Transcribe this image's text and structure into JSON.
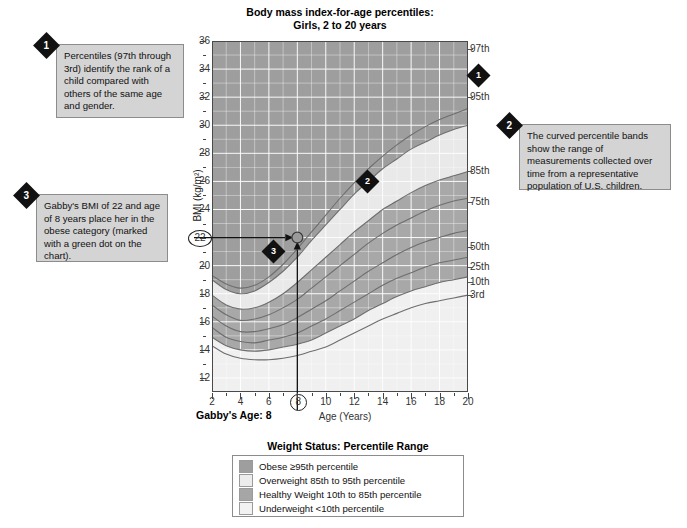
{
  "chart_data": {
    "type": "line",
    "title": "Body mass index-for-age percentiles:\nGirls, 2 to 20 years",
    "title_line1": "Body mass index-for-age percentiles:",
    "title_line2": "Girls, 2 to 20 years",
    "xlabel": "Age (Years)",
    "ylabel": "BMI (kg/m²)",
    "xlim": [
      2,
      20
    ],
    "ylim": [
      11,
      36
    ],
    "grid": true,
    "x_ticks": [
      "2",
      "4",
      "6",
      "8",
      "10",
      "12",
      "14",
      "16",
      "18",
      "20"
    ],
    "y_ticks": [
      "12",
      "14",
      "16",
      "18",
      "20",
      "22",
      "24",
      "26",
      "28",
      "30",
      "32",
      "34",
      "36"
    ],
    "highlighted_x_tick": "8",
    "highlighted_y_tick": "22",
    "legend_position": "right-of-axes",
    "series": [
      {
        "name": "97th",
        "x": [
          2,
          3,
          4,
          5,
          6,
          7,
          8,
          9,
          10,
          11,
          12,
          13,
          14,
          15,
          16,
          17,
          18,
          19,
          20
        ],
        "values": [
          19.3,
          18.7,
          18.4,
          18.6,
          19.2,
          20.1,
          21.2,
          22.4,
          23.6,
          24.8,
          25.9,
          26.9,
          27.8,
          28.6,
          29.3,
          29.9,
          30.4,
          30.8,
          31.2
        ]
      },
      {
        "name": "95th",
        "x": [
          2,
          3,
          4,
          5,
          6,
          7,
          8,
          9,
          10,
          11,
          12,
          13,
          14,
          15,
          16,
          17,
          18,
          19,
          20
        ],
        "values": [
          19.0,
          18.3,
          18.0,
          18.2,
          18.8,
          19.6,
          20.6,
          21.8,
          22.9,
          24.0,
          25.1,
          26.0,
          26.9,
          27.6,
          28.3,
          28.8,
          29.3,
          29.7,
          30.0
        ]
      },
      {
        "name": "85th",
        "x": [
          2,
          3,
          4,
          5,
          6,
          7,
          8,
          9,
          10,
          11,
          12,
          13,
          14,
          15,
          16,
          17,
          18,
          19,
          20
        ],
        "values": [
          17.9,
          17.2,
          16.9,
          17.0,
          17.4,
          18.0,
          18.8,
          19.7,
          20.6,
          21.5,
          22.4,
          23.2,
          24.0,
          24.6,
          25.2,
          25.7,
          26.1,
          26.4,
          26.7
        ]
      },
      {
        "name": "75th",
        "x": [
          2,
          3,
          4,
          5,
          6,
          7,
          8,
          9,
          10,
          11,
          12,
          13,
          14,
          15,
          16,
          17,
          18,
          19,
          20
        ],
        "values": [
          17.2,
          16.5,
          16.1,
          16.2,
          16.5,
          17.0,
          17.6,
          18.4,
          19.2,
          20.0,
          20.8,
          21.6,
          22.3,
          22.9,
          23.4,
          23.9,
          24.3,
          24.6,
          24.8
        ]
      },
      {
        "name": "50th",
        "x": [
          2,
          3,
          4,
          5,
          6,
          7,
          8,
          9,
          10,
          11,
          12,
          13,
          14,
          15,
          16,
          17,
          18,
          19,
          20
        ],
        "values": [
          16.4,
          15.7,
          15.3,
          15.3,
          15.5,
          15.8,
          16.3,
          16.9,
          17.5,
          18.2,
          18.9,
          19.6,
          20.2,
          20.8,
          21.3,
          21.7,
          22.0,
          22.3,
          22.5
        ]
      },
      {
        "name": "25th",
        "x": [
          2,
          3,
          4,
          5,
          6,
          7,
          8,
          9,
          10,
          11,
          12,
          13,
          14,
          15,
          16,
          17,
          18,
          19,
          20
        ],
        "values": [
          15.6,
          14.9,
          14.6,
          14.5,
          14.7,
          14.9,
          15.2,
          15.7,
          16.2,
          16.8,
          17.4,
          18.0,
          18.6,
          19.1,
          19.5,
          19.9,
          20.2,
          20.4,
          20.6
        ]
      },
      {
        "name": "10th",
        "x": [
          2,
          3,
          4,
          5,
          6,
          7,
          8,
          9,
          10,
          11,
          12,
          13,
          14,
          15,
          16,
          17,
          18,
          19,
          20
        ],
        "values": [
          14.9,
          14.3,
          14.0,
          13.9,
          14.0,
          14.2,
          14.4,
          14.7,
          15.2,
          15.7,
          16.2,
          16.8,
          17.3,
          17.8,
          18.2,
          18.5,
          18.8,
          19.0,
          19.2
        ]
      },
      {
        "name": "3rd",
        "x": [
          2,
          3,
          4,
          5,
          6,
          7,
          8,
          9,
          10,
          11,
          12,
          13,
          14,
          15,
          16,
          17,
          18,
          19,
          20
        ],
        "values": [
          14.3,
          13.7,
          13.4,
          13.3,
          13.3,
          13.4,
          13.6,
          13.9,
          14.2,
          14.7,
          15.2,
          15.7,
          16.2,
          16.6,
          17.0,
          17.3,
          17.5,
          17.7,
          17.9
        ]
      }
    ],
    "percentile_labels": [
      "97th",
      "95th",
      "85th",
      "75th",
      "50th",
      "25th",
      "10th",
      "3rd"
    ],
    "marked_point": {
      "x": 8,
      "y": 22,
      "label": "Gabby",
      "color": "#8a8a8a"
    },
    "bands": [
      {
        "name": "Obese ≥95th percentile",
        "color": "#9e9e9e"
      },
      {
        "name": "Overweight 85th to 95th percentile",
        "color": "#e8e8e8"
      },
      {
        "name": "Healthy Weight 10th to 85th percentile",
        "color": "#a8a8a8"
      },
      {
        "name": "Underweight <10th percentile",
        "color": "#efefef"
      }
    ]
  },
  "axis": {
    "gabby_age_label": "Gabby's Age: 8",
    "age_label": "Age (Years)",
    "bmi_label": "BMI (kg/m²)"
  },
  "callouts": [
    {
      "number": "1",
      "text": "Percentiles (97th through 3rd) identify the rank of a child compared with others of the same age and gender."
    },
    {
      "number": "2",
      "text": "The curved percentile bands show the range of measurements collected over time from a representative population of U.S. children."
    },
    {
      "number": "3",
      "text": "Gabby's BMI of 22 and age of 8 years place her in the obese category (marked with a green dot on the chart)."
    }
  ],
  "markers": {
    "marker1": "1",
    "marker2": "2",
    "marker3": "3"
  },
  "legend": {
    "title": "Weight Status: Percentile Range",
    "items": [
      {
        "label": "Obese ≥95th percentile",
        "color": "#9e9e9e"
      },
      {
        "label": "Overweight 85th to 95th percentile",
        "color": "#ececec"
      },
      {
        "label": "Healthy Weight 10th to 85th percentile",
        "color": "#a6a6a6"
      },
      {
        "label": "Underweight <10th percentile",
        "color": "#f2f2f2"
      }
    ]
  }
}
